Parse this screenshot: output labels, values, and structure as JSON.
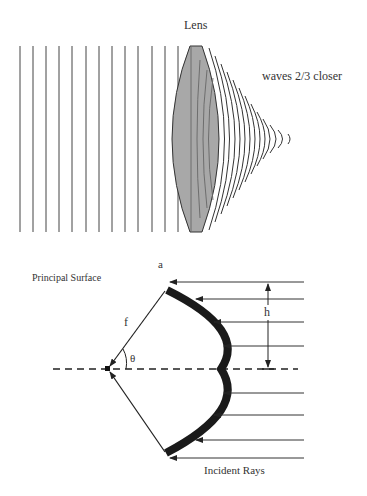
{
  "top_panel": {
    "lens_label": "Lens",
    "waves_label": "waves 2/3 closer",
    "plane_wave_count": 13,
    "converging_wave_count": 13,
    "lens_fill": "#a8a8a8",
    "line_color": "#333333"
  },
  "bottom_panel": {
    "principal_surface_label": "Principal Surface",
    "aperture_label": "a",
    "focal_length_label": "f",
    "angle_label": "θ",
    "height_label": "h",
    "incident_rays_label": "Incident Rays",
    "incident_ray_count": 8,
    "surface_color": "#1a1a1a"
  }
}
